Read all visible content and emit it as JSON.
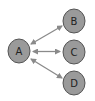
{
  "diagram": {
    "type": "hub-and-spoke",
    "colors": {
      "node_fill": "#9a9a9a",
      "node_stroke": "#555555",
      "edge": "#8a8a8a",
      "text": "#222222"
    },
    "nodes": [
      {
        "id": "A",
        "label": "A",
        "cx": 19,
        "cy": 51
      },
      {
        "id": "B",
        "label": "B",
        "cx": 74,
        "cy": 21
      },
      {
        "id": "C",
        "label": "C",
        "cx": 74,
        "cy": 52
      },
      {
        "id": "D",
        "label": "D",
        "cx": 74,
        "cy": 83
      }
    ],
    "edges": [
      {
        "from": "A",
        "to": "B",
        "direction": "bidirectional"
      },
      {
        "from": "A",
        "to": "C",
        "direction": "bidirectional"
      },
      {
        "from": "A",
        "to": "D",
        "direction": "bidirectional"
      }
    ]
  }
}
